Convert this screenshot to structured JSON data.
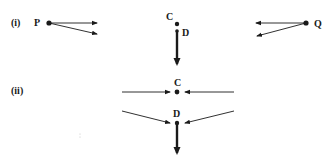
{
  "parts": [
    {
      "label": "(i)",
      "points": {
        "P": "P",
        "C": "C",
        "D": "D",
        "Q": "Q"
      }
    },
    {
      "label": "(ii)",
      "points": {
        "C": "C",
        "D": "D"
      }
    }
  ],
  "colors": {
    "ink": "#1a1a1a",
    "background": "#ffffff"
  }
}
